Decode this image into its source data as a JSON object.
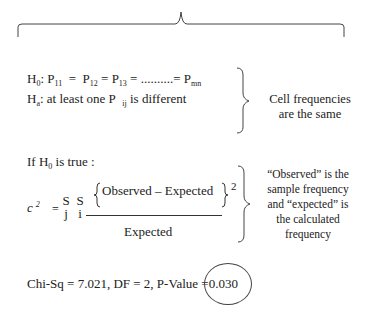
{
  "hypotheses": {
    "h0_label": "H",
    "h0_sub": "0",
    "h0_colon": ":",
    "h0_p1": "P",
    "h0_p1_sub": "11",
    "h0_eq1": "=",
    "h0_p2": "P",
    "h0_p2_sub": "12",
    "h0_eq2": "=",
    "h0_p3": "P",
    "h0_p3_sub": "13",
    "h0_dots": "= ..........=",
    "h0_pmn": "P",
    "h0_pmn_sub": "mn",
    "ha_label": "H",
    "ha_sub": "a",
    "ha_text_pre": ": at least one P",
    "ha_pij_sub": "ij",
    "ha_text_post": "is different"
  },
  "note_cell_frequencies": {
    "line1": "Cell frequencies",
    "line2": "are the same"
  },
  "if_true": {
    "pre": "If H",
    "sub": "0",
    "post": "is true :"
  },
  "formula": {
    "chi_symbol": "c",
    "chi_power": "2",
    "equals": "=",
    "sigma_j_top": "S",
    "sigma_j_bottom": "j",
    "sigma_i_top": "S",
    "sigma_i_bottom": "i",
    "numerator": "Observed – Expected",
    "numerator_power": "2",
    "denominator": "Expected"
  },
  "note_observed_expected": {
    "line1": "“Observed” is the",
    "line2": "sample frequency",
    "line3": "and “expected” is",
    "line4": "the calculated",
    "line5": "frequency"
  },
  "result": {
    "text": "Chi-Sq = 7.021, DF = 2, P-Value =",
    "p_value": "0.030"
  }
}
